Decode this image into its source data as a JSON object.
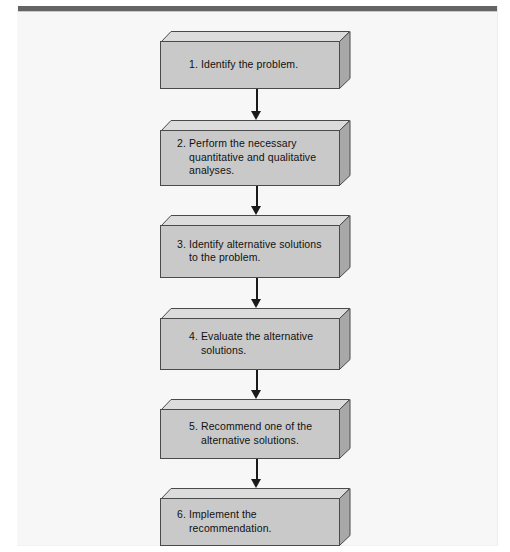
{
  "figure": {
    "type": "flowchart",
    "orientation": "vertical",
    "colors": {
      "page_background": "#f7f7f7",
      "top_rule": "#646464",
      "box_front_face": "#c9c9c9",
      "box_top_face": "#dcdcdc",
      "box_right_face": "#a8a8a8",
      "box_outline": "#4a4a4a",
      "arrow": "#1a1a1a",
      "text": "#111111"
    }
  },
  "flow": {
    "step_count": 6,
    "connector_count": 5,
    "nodes": [
      {
        "number": "1.",
        "text": "1. Identify the problem.",
        "lines": [
          "1. Identify the problem."
        ]
      },
      {
        "number": "2.",
        "text": "2. Perform the necessary quantitative and qualitative analyses.",
        "lines": [
          "2. Perform the necessary",
          "quantitative and qualitative",
          "analyses."
        ]
      },
      {
        "number": "3.",
        "text": "3. Identify alternative solutions to the problem.",
        "lines": [
          "3. Identify alternative solutions to",
          "the problem."
        ]
      },
      {
        "number": "4.",
        "text": "4. Evaluate the alternative solutions.",
        "lines": [
          "4. Evaluate the alternative",
          "solutions."
        ]
      },
      {
        "number": "5.",
        "text": "5. Recommend one of the alternative solutions.",
        "lines": [
          "5. Recommend one of the",
          "alternative solutions."
        ]
      },
      {
        "number": "6.",
        "text": "6. Implement the recommendation.",
        "lines": [
          "6. Implement the",
          "recommendation."
        ]
      }
    ],
    "connectors": [
      {
        "from": "1",
        "to": "2",
        "glyph": "down-arrow"
      },
      {
        "from": "2",
        "to": "3",
        "glyph": "down-arrow"
      },
      {
        "from": "3",
        "to": "4",
        "glyph": "down-arrow"
      },
      {
        "from": "4",
        "to": "5",
        "glyph": "down-arrow"
      },
      {
        "from": "5",
        "to": "6",
        "glyph": "down-arrow"
      }
    ]
  }
}
